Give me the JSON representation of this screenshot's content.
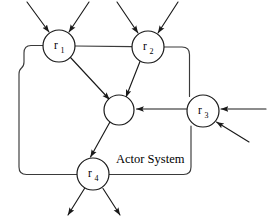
{
  "diagram": {
    "title": "Actor System",
    "system_label": "Actor System",
    "canvas": {
      "width": 268,
      "height": 223
    },
    "colors": {
      "background": "#ffffff",
      "line": "#1a1a1a",
      "boundary": "#3a3a3a",
      "node_fill": "#ffffff",
      "text": "#000000"
    },
    "nodes": [
      {
        "id": "r1",
        "base": "r",
        "subscript": "1",
        "label": "r1",
        "cx": 59,
        "cy": 46,
        "r": 16,
        "on_boundary": true
      },
      {
        "id": "r2",
        "base": "r",
        "subscript": "2",
        "label": "r2",
        "cx": 148,
        "cy": 47,
        "r": 16,
        "on_boundary": true
      },
      {
        "id": "center",
        "base": "",
        "subscript": "",
        "label": "",
        "cx": 119,
        "cy": 110,
        "r": 15,
        "on_boundary": false
      },
      {
        "id": "r3",
        "base": "r",
        "subscript": "3",
        "label": "r3",
        "cx": 203,
        "cy": 111,
        "r": 16,
        "on_boundary": true
      },
      {
        "id": "r4",
        "base": "r",
        "subscript": "4",
        "label": "r4",
        "cx": 93,
        "cy": 174,
        "r": 16,
        "on_boundary": true
      }
    ],
    "internal_edges": [
      {
        "from": "r1",
        "to": "center",
        "kind": "directed"
      },
      {
        "from": "r2",
        "to": "center",
        "kind": "directed"
      },
      {
        "from": "r3",
        "to": "center",
        "kind": "directed"
      },
      {
        "from": "center",
        "to": "r4",
        "kind": "directed"
      }
    ],
    "external_arrows": [
      {
        "id": "in-r1-left",
        "direction": "in",
        "target": "r1",
        "from_side": "top-left"
      },
      {
        "id": "in-r1-right",
        "direction": "in",
        "target": "r1",
        "from_side": "top-right"
      },
      {
        "id": "in-r2-left",
        "direction": "in",
        "target": "r2",
        "from_side": "top-left"
      },
      {
        "id": "in-r2-right",
        "direction": "in",
        "target": "r2",
        "from_side": "top-right"
      },
      {
        "id": "in-r3-horizontal",
        "direction": "in",
        "target": "r3",
        "from_side": "right"
      },
      {
        "id": "in-r3-diagonal",
        "direction": "in",
        "target": "r3",
        "from_side": "bottom-right"
      },
      {
        "id": "out-r4-left",
        "direction": "out",
        "source": "r4",
        "to_side": "bottom-left"
      },
      {
        "id": "out-r4-right",
        "direction": "out",
        "source": "r4",
        "to_side": "bottom-right"
      }
    ],
    "boundary": {
      "shape": "rounded-rectangle",
      "description": "Actor System boundary passing through r1, r2, r3 and r4"
    }
  }
}
